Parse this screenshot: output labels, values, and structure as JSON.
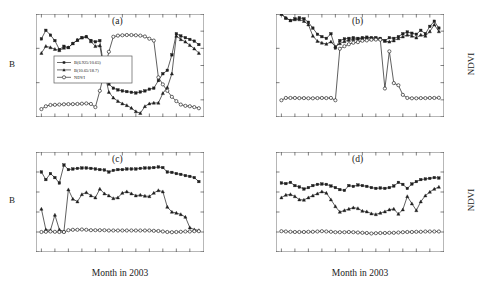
{
  "figure": {
    "xlabel": "Month in 2003",
    "left_axis_label": "B",
    "right_axis_label": "NDVI",
    "months": [
      "Jan",
      "Feb",
      "Mar",
      "Apr",
      "May",
      "Jun",
      "Jul",
      "Aug",
      "Sep",
      "Oct",
      "Nov",
      "Dec"
    ]
  },
  "legend": {
    "items": [
      {
        "label": "B(6.925/10.65)",
        "marker": "filled-square"
      },
      {
        "label": "B(10.65/18.7)",
        "marker": "filled-triangle"
      },
      {
        "label": "NDVI",
        "marker": "open-circle"
      }
    ]
  },
  "chart_data": [
    {
      "type": "line",
      "title": "(a)",
      "xlabel": "Month in 2003",
      "ylabel": "B",
      "y2label": "NDVI",
      "ylim": [
        0.4,
        1.0
      ],
      "y2lim": [
        -0.2,
        1.0
      ],
      "yticks": [
        0.4,
        0.6,
        0.8,
        1
      ],
      "y2ticks": [
        -0.2,
        0,
        0.2,
        0.4,
        0.6,
        0.8,
        1
      ],
      "categories": [
        "Jan",
        "Feb",
        "Mar",
        "Apr",
        "May",
        "Jun",
        "Jul",
        "Aug",
        "Sep",
        "Oct",
        "Nov",
        "Dec"
      ],
      "x": [
        1,
        1.33,
        1.67,
        2,
        2.33,
        2.67,
        3,
        3.33,
        3.67,
        4,
        4.33,
        4.67,
        5,
        5.33,
        5.67,
        6,
        6.33,
        6.67,
        7,
        7.33,
        7.67,
        8,
        8.33,
        8.67,
        9,
        9.33,
        9.67,
        10,
        10.33,
        10.67,
        11,
        11.33,
        11.67,
        12,
        12.33,
        12.67
      ],
      "grid": false,
      "legend_position": "center-left",
      "series": [
        {
          "name": "B(6.925/10.65)",
          "axis": "left",
          "marker": "filled-square",
          "values": [
            0.855,
            0.905,
            0.877,
            0.845,
            0.793,
            0.812,
            0.805,
            0.828,
            0.848,
            0.862,
            0.868,
            0.846,
            0.838,
            0.845,
            0.668,
            0.592,
            0.568,
            0.558,
            0.552,
            0.548,
            0.544,
            0.54,
            0.546,
            0.552,
            0.562,
            0.568,
            0.612,
            0.652,
            0.672,
            0.762,
            0.885,
            0.872,
            0.862,
            0.852,
            0.842,
            0.822
          ]
        },
        {
          "name": "B(10.65/18.7)",
          "axis": "left",
          "marker": "filled-triangle",
          "values": [
            0.772,
            0.812,
            0.805,
            0.795,
            0.788,
            0.802,
            0.805,
            0.828,
            0.848,
            0.862,
            0.868,
            0.84,
            0.812,
            0.816,
            0.662,
            0.545,
            0.512,
            0.492,
            0.478,
            0.468,
            0.452,
            0.432,
            0.422,
            0.462,
            0.478,
            0.482,
            0.482,
            0.538,
            0.572,
            0.652,
            0.872,
            0.852,
            0.838,
            0.818,
            0.798,
            0.772
          ]
        },
        {
          "name": "NDVI",
          "axis": "right",
          "marker": "open-circle",
          "values": [
            -0.108,
            -0.075,
            -0.06,
            -0.058,
            -0.055,
            -0.052,
            -0.05,
            -0.05,
            -0.048,
            -0.045,
            -0.042,
            -0.048,
            -0.085,
            0.105,
            0.33,
            0.56,
            0.735,
            0.748,
            0.752,
            0.755,
            0.755,
            0.752,
            0.748,
            0.738,
            0.712,
            0.69,
            0.262,
            0.18,
            0.105,
            0.035,
            -0.015,
            -0.055,
            -0.07,
            -0.075,
            -0.085,
            -0.098
          ]
        }
      ]
    },
    {
      "type": "line",
      "title": "(b)",
      "xlabel": "Month in 2003",
      "ylabel": "B",
      "y2label": "NDVI",
      "ylim": [
        0.4,
        1.0
      ],
      "y2lim": [
        -0.2,
        1.0
      ],
      "yticks": [
        0.4,
        0.6,
        0.8,
        1
      ],
      "y2ticks": [
        -0.2,
        0,
        0.2,
        0.4,
        0.6,
        0.8,
        1
      ],
      "categories": [
        "Jan",
        "Feb",
        "Mar",
        "Apr",
        "May",
        "Jun",
        "Jul",
        "Aug",
        "Sep",
        "Oct",
        "Nov",
        "Dec"
      ],
      "x": [
        1,
        1.33,
        1.67,
        2,
        2.33,
        2.67,
        3,
        3.33,
        3.67,
        4,
        4.33,
        4.67,
        5,
        5.33,
        5.67,
        6,
        6.33,
        6.67,
        7,
        7.33,
        7.67,
        8,
        8.33,
        8.67,
        9,
        9.33,
        9.67,
        10,
        10.33,
        10.67,
        11,
        11.33,
        11.67,
        12,
        12.33,
        12.67
      ],
      "grid": false,
      "legend_position": "none",
      "series": [
        {
          "name": "B(6.925/10.65)",
          "axis": "left",
          "marker": "filled-square",
          "values": [
            1.0,
            0.975,
            0.962,
            0.972,
            0.978,
            0.972,
            0.952,
            0.918,
            0.882,
            0.868,
            0.858,
            0.885,
            0.802,
            0.845,
            0.855,
            0.858,
            0.862,
            0.858,
            0.862,
            0.865,
            0.862,
            0.862,
            0.858,
            0.845,
            0.862,
            0.858,
            0.868,
            0.885,
            0.895,
            0.888,
            0.882,
            0.905,
            0.885,
            0.928,
            0.958,
            0.918
          ]
        },
        {
          "name": "B(10.65/18.7)",
          "axis": "left",
          "marker": "filled-triangle",
          "values": [
            1.0,
            0.978,
            0.962,
            0.968,
            0.968,
            0.958,
            0.938,
            0.872,
            0.842,
            0.832,
            0.825,
            0.838,
            0.81,
            0.828,
            0.84,
            0.848,
            0.852,
            0.855,
            0.858,
            0.862,
            0.858,
            0.858,
            0.855,
            0.842,
            0.838,
            0.845,
            0.858,
            0.868,
            0.878,
            0.872,
            0.862,
            0.878,
            0.872,
            0.898,
            0.938,
            0.898
          ]
        },
        {
          "name": "NDVI",
          "axis": "right",
          "marker": "open-circle",
          "values": [
            -0.005,
            0.022,
            0.022,
            0.022,
            0.02,
            0.02,
            0.018,
            0.018,
            0.02,
            0.022,
            0.02,
            0.022,
            -0.005,
            0.595,
            0.625,
            0.648,
            0.665,
            0.672,
            0.688,
            0.692,
            0.7,
            0.702,
            0.7,
            0.132,
            0.565,
            0.195,
            0.17,
            0.058,
            0.022,
            0.018,
            0.018,
            0.02,
            0.02,
            0.022,
            0.022,
            0.024
          ]
        }
      ]
    },
    {
      "type": "line",
      "title": "(c)",
      "xlabel": "Month in 2003",
      "ylabel": "B",
      "y2label": "NDVI",
      "ylim": [
        0.5,
        1.0
      ],
      "y2lim": [
        0.0,
        1.0
      ],
      "yticks": [
        0.5,
        0.6,
        0.7,
        0.8,
        0.9,
        1
      ],
      "y2ticks": [
        0,
        0.2,
        0.4,
        0.6,
        0.8,
        1
      ],
      "categories": [
        "Jan",
        "Feb",
        "Mar",
        "Apr",
        "May",
        "Jun",
        "Jul",
        "Aug",
        "Sep",
        "Oct",
        "Nov",
        "Dec"
      ],
      "x": [
        1,
        1.33,
        1.67,
        2,
        2.33,
        2.67,
        3,
        3.33,
        3.67,
        4,
        4.33,
        4.67,
        5,
        5.33,
        5.67,
        6,
        6.33,
        6.67,
        7,
        7.33,
        7.67,
        8,
        8.33,
        8.67,
        9,
        9.33,
        9.67,
        10,
        10.33,
        10.67,
        11,
        11.33,
        11.67,
        12,
        12.33,
        12.67
      ],
      "grid": false,
      "legend_position": "none",
      "series": [
        {
          "name": "B(6.925/10.65)",
          "axis": "left",
          "marker": "filled-square",
          "values": [
            0.9,
            0.862,
            0.892,
            0.872,
            0.845,
            0.935,
            0.912,
            0.915,
            0.918,
            0.92,
            0.92,
            0.918,
            0.915,
            0.912,
            0.91,
            0.9,
            0.908,
            0.912,
            0.912,
            0.915,
            0.915,
            0.915,
            0.918,
            0.92,
            0.92,
            0.922,
            0.925,
            0.922,
            0.9,
            0.898,
            0.892,
            0.888,
            0.882,
            0.878,
            0.872,
            0.852
          ]
        },
        {
          "name": "B(10.65/18.7)",
          "axis": "left",
          "marker": "filled-triangle",
          "values": [
            0.715,
            0.612,
            0.608,
            0.685,
            0.612,
            0.602,
            0.812,
            0.765,
            0.752,
            0.788,
            0.798,
            0.782,
            0.772,
            0.815,
            0.792,
            0.782,
            0.768,
            0.772,
            0.795,
            0.802,
            0.792,
            0.782,
            0.785,
            0.78,
            0.778,
            0.795,
            0.808,
            0.802,
            0.725,
            0.7,
            0.695,
            0.688,
            0.675,
            0.622,
            0.612,
            0.608
          ]
        },
        {
          "name": "NDVI",
          "axis": "right",
          "marker": "open-circle",
          "values": [
            0.2,
            0.202,
            0.205,
            0.202,
            0.2,
            0.2,
            0.218,
            0.222,
            0.222,
            0.225,
            0.222,
            0.218,
            0.218,
            0.218,
            0.218,
            0.215,
            0.215,
            0.215,
            0.215,
            0.215,
            0.215,
            0.215,
            0.215,
            0.215,
            0.215,
            0.212,
            0.21,
            0.205,
            0.2,
            0.198,
            0.2,
            0.202,
            0.205,
            0.205,
            0.208,
            0.208
          ]
        }
      ]
    },
    {
      "type": "line",
      "title": "(d)",
      "xlabel": "Month in 2003",
      "ylabel": "B",
      "y2label": "NDVI",
      "ylim": [
        0.5,
        1.0
      ],
      "y2lim": [
        0.0,
        1.0
      ],
      "yticks": [
        0.5,
        0.6,
        0.7,
        0.8,
        0.9,
        1
      ],
      "y2ticks": [
        0,
        0.2,
        0.4,
        0.6,
        0.8,
        1
      ],
      "categories": [
        "Jan",
        "Feb",
        "Mar",
        "Apr",
        "May",
        "Jun",
        "Jul",
        "Aug",
        "Sep",
        "Oct",
        "Nov",
        "Dec"
      ],
      "x": [
        1,
        1.33,
        1.67,
        2,
        2.33,
        2.67,
        3,
        3.33,
        3.67,
        4,
        4.33,
        4.67,
        5,
        5.33,
        5.67,
        6,
        6.33,
        6.67,
        7,
        7.33,
        7.67,
        8,
        8.33,
        8.67,
        9,
        9.33,
        9.67,
        10,
        10.33,
        10.67,
        11,
        11.33,
        11.67,
        12,
        12.33,
        12.67
      ],
      "grid": false,
      "legend_position": "none",
      "series": [
        {
          "name": "B(6.925/10.65)",
          "axis": "left",
          "marker": "filled-square",
          "values": [
            0.845,
            0.842,
            0.848,
            0.832,
            0.825,
            0.815,
            0.822,
            0.832,
            0.838,
            0.84,
            0.838,
            0.83,
            0.822,
            0.812,
            0.808,
            0.832,
            0.828,
            0.835,
            0.832,
            0.828,
            0.822,
            0.818,
            0.82,
            0.818,
            0.822,
            0.83,
            0.848,
            0.838,
            0.818,
            0.84,
            0.852,
            0.862,
            0.865,
            0.868,
            0.872,
            0.87
          ]
        },
        {
          "name": "B(10.65/18.7)",
          "axis": "left",
          "marker": "filled-triangle",
          "values": [
            0.772,
            0.785,
            0.788,
            0.778,
            0.762,
            0.76,
            0.772,
            0.782,
            0.792,
            0.802,
            0.795,
            0.762,
            0.728,
            0.7,
            0.708,
            0.715,
            0.722,
            0.718,
            0.705,
            0.702,
            0.692,
            0.688,
            0.695,
            0.702,
            0.712,
            0.715,
            0.69,
            0.712,
            0.778,
            0.742,
            0.708,
            0.752,
            0.782,
            0.8,
            0.815,
            0.825
          ]
        },
        {
          "name": "NDVI",
          "axis": "right",
          "marker": "open-circle",
          "values": [
            0.208,
            0.205,
            0.202,
            0.2,
            0.2,
            0.2,
            0.202,
            0.202,
            0.205,
            0.208,
            0.205,
            0.202,
            0.198,
            0.198,
            0.198,
            0.2,
            0.198,
            0.195,
            0.192,
            0.19,
            0.185,
            0.188,
            0.19,
            0.19,
            0.192,
            0.192,
            0.195,
            0.198,
            0.2,
            0.2,
            0.202,
            0.202,
            0.205,
            0.205,
            0.205,
            0.205
          ]
        }
      ]
    }
  ]
}
